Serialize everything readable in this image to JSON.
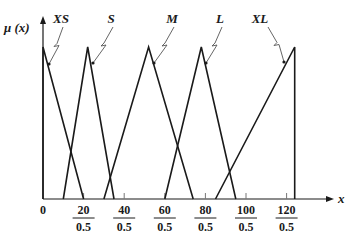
{
  "chart_data": {
    "type": "line",
    "title": "",
    "xlabel": "x",
    "ylabel": "μ (x)",
    "x_ticks": [
      {
        "value": 0,
        "label": "0"
      },
      {
        "value": 20,
        "label": "20/0.5",
        "num": "20",
        "den": "0.5"
      },
      {
        "value": 40,
        "label": "40/0.5",
        "num": "40",
        "den": "0.5"
      },
      {
        "value": 60,
        "label": "60/0.5",
        "num": "60",
        "den": "0.5"
      },
      {
        "value": 80,
        "label": "80/0.5",
        "num": "80",
        "den": "0.5"
      },
      {
        "value": 100,
        "label": "100/0.5",
        "num": "100",
        "den": "0.5"
      },
      {
        "value": 120,
        "label": "120/0.5",
        "num": "120",
        "den": "0.5"
      }
    ],
    "xlim": [
      0,
      135
    ],
    "ylim": [
      0,
      1
    ],
    "grid": false,
    "legend": "inline labels with leader arrows",
    "series": [
      {
        "name": "XS",
        "x": [
          0,
          0,
          20
        ],
        "y": [
          0,
          1,
          0
        ]
      },
      {
        "name": "S",
        "x": [
          10,
          22,
          35
        ],
        "y": [
          0,
          1,
          0
        ]
      },
      {
        "name": "M",
        "x": [
          30,
          52,
          74
        ],
        "y": [
          0,
          1,
          0
        ]
      },
      {
        "name": "L",
        "x": [
          60,
          78,
          95
        ],
        "y": [
          0,
          1,
          0
        ]
      },
      {
        "name": "XL",
        "x": [
          85,
          124,
          124
        ],
        "y": [
          0,
          1,
          0
        ]
      }
    ]
  },
  "labels": {
    "y_axis": "μ (x)",
    "x_axis": "x",
    "origin": "0",
    "sets": [
      "XS",
      "S",
      "M",
      "L",
      "XL"
    ]
  }
}
